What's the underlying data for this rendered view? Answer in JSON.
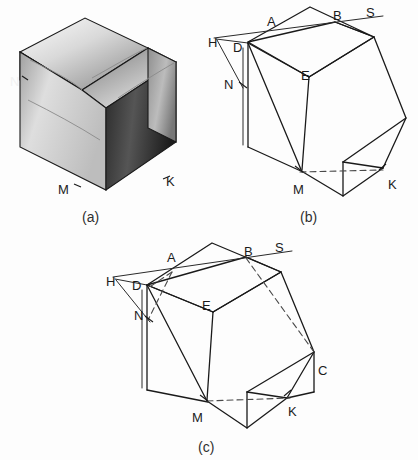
{
  "figure": {
    "background_color": "#fdfdfd",
    "ink_color": "#1a1a1a",
    "panels": [
      {
        "id": "a",
        "caption": "(a)",
        "type": "shaded-pictorial",
        "description": "Shaded rendering of the solid",
        "labels": [
          {
            "text": "N",
            "x": 14,
            "y": 82,
            "color": "#f2f2f2"
          },
          {
            "text": "M",
            "x": 62,
            "y": 188,
            "color": "#1b1b1b"
          },
          {
            "text": "K",
            "x": 163,
            "y": 182,
            "color": "#1b1b1b"
          }
        ]
      },
      {
        "id": "b",
        "caption": "(b)",
        "type": "line-construction",
        "description": "Wireframe with construction lines H-A-B-S and hidden edge M-K",
        "labels": [
          {
            "text": "H",
            "x": 212,
            "y": 43
          },
          {
            "text": "D",
            "x": 237,
            "y": 48
          },
          {
            "text": "A",
            "x": 271,
            "y": 22
          },
          {
            "text": "B",
            "x": 337,
            "y": 16
          },
          {
            "text": "S",
            "x": 369,
            "y": 13
          },
          {
            "text": "N",
            "x": 228,
            "y": 85
          },
          {
            "text": "E",
            "x": 305,
            "y": 76
          },
          {
            "text": "M",
            "x": 298,
            "y": 190
          },
          {
            "text": "K",
            "x": 392,
            "y": 185
          }
        ]
      },
      {
        "id": "c",
        "caption": "(c)",
        "type": "line-construction",
        "description": "Wireframe with added cutting plane through A, B, C and hidden edges",
        "labels": [
          {
            "text": "H",
            "x": 110,
            "y": 282
          },
          {
            "text": "D",
            "x": 136,
            "y": 285
          },
          {
            "text": "A",
            "x": 171,
            "y": 258
          },
          {
            "text": "B",
            "x": 248,
            "y": 251
          },
          {
            "text": "S",
            "x": 278,
            "y": 248
          },
          {
            "text": "N",
            "x": 138,
            "y": 314
          },
          {
            "text": "E",
            "x": 206,
            "y": 305
          },
          {
            "text": "C",
            "x": 321,
            "y": 370
          },
          {
            "text": "M",
            "x": 197,
            "y": 417
          },
          {
            "text": "K",
            "x": 291,
            "y": 411
          }
        ]
      }
    ],
    "vertex_names": [
      "A",
      "B",
      "C",
      "D",
      "E",
      "H",
      "K",
      "M",
      "N",
      "S"
    ],
    "captions": {
      "a": "(a)",
      "b": "(b)",
      "c": "(c)"
    }
  }
}
